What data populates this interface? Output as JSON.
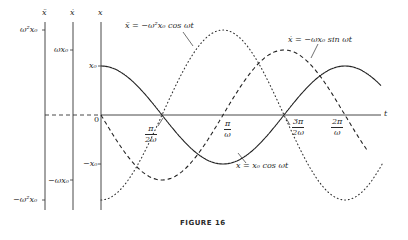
{
  "figure": {
    "caption": "FIGURE 16"
  },
  "axes": {
    "x_axis_label": "x",
    "xdot_axis_label": "ẋ",
    "xddot_axis_label": "ẍ",
    "t_label": "t",
    "origin_label": "0",
    "x_ticks": {
      "pos": "x₀",
      "neg": "−x₀"
    },
    "xdot_ticks": {
      "pos": "ωx₀",
      "neg": "−ωx₀"
    },
    "xddot_ticks": {
      "pos": "ω²x₀",
      "neg": "−ω²x₀"
    },
    "t_ticks": [
      {
        "num": "π",
        "den": "2ω"
      },
      {
        "num": "π",
        "den": "ω"
      },
      {
        "num": "3π",
        "den": "2ω"
      },
      {
        "num": "2π",
        "den": "ω"
      }
    ]
  },
  "annotations": {
    "accel": "ẍ = −ω²x₀ cos ωt",
    "vel": "ẋ = −ωx₀ sin ωt",
    "pos": "x = x₀ cos ωt"
  },
  "chart_data": {
    "type": "line",
    "title": "FIGURE 16",
    "xlabel": "t",
    "ylabel": "x, ẋ, ẍ",
    "x_ticks": [
      "0",
      "π/2ω",
      "π/ω",
      "3π/2ω",
      "2π/ω"
    ],
    "x_range_periods": [
      0,
      1.15
    ],
    "grid": false,
    "legend": "inline annotations",
    "series": [
      {
        "name": "x = x₀ cos ωt",
        "style": "solid",
        "amplitude": "x₀",
        "relative_amplitude": 1.0,
        "points": [
          [
            0,
            1
          ],
          [
            0.25,
            0
          ],
          [
            0.5,
            -1
          ],
          [
            0.75,
            0
          ],
          [
            1.0,
            1
          ]
        ]
      },
      {
        "name": "ẋ = −ωx₀ sin ωt",
        "style": "dashed",
        "amplitude": "ωx₀",
        "relative_amplitude": 1.33,
        "points": [
          [
            0,
            0
          ],
          [
            0.25,
            -1
          ],
          [
            0.5,
            0
          ],
          [
            0.75,
            1
          ],
          [
            1.0,
            0
          ]
        ]
      },
      {
        "name": "ẍ = −ω²x₀ cos ωt",
        "style": "dotted",
        "amplitude": "ω²x₀",
        "relative_amplitude": 1.73,
        "points": [
          [
            0,
            -1
          ],
          [
            0.25,
            0
          ],
          [
            0.5,
            1
          ],
          [
            0.75,
            0
          ],
          [
            1.0,
            -1
          ]
        ]
      }
    ],
    "note": "x-values in fractions of the period 2π/ω; y-values normalized to each series' amplitude"
  }
}
